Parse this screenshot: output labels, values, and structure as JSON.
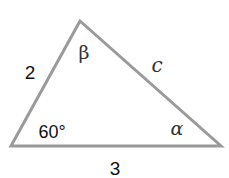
{
  "diagram": {
    "type": "triangle",
    "stroke_color": "#9a9a9a",
    "vertices": {
      "top": [
        80,
        21
      ],
      "left": [
        11,
        146
      ],
      "right": [
        221,
        146
      ]
    },
    "labels": {
      "side_left": "2",
      "side_bottom": "3",
      "side_right": "c",
      "angle_left": "60°",
      "angle_top": "β",
      "angle_right": "α"
    }
  }
}
